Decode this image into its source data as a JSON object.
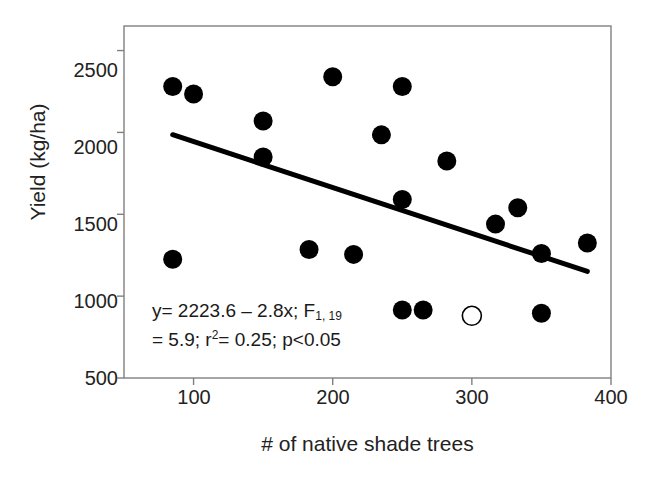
{
  "chart_data": {
    "type": "scatter",
    "title": "",
    "xlabel": "# of native shade trees",
    "ylabel": "Yield (kg/ha)",
    "xlim": [
      50,
      400
    ],
    "ylim": [
      500,
      2650
    ],
    "xticks": [
      100,
      200,
      300,
      400
    ],
    "yticks": [
      500,
      1000,
      1500,
      2000,
      2500
    ],
    "grid": false,
    "legend": "none",
    "series": [
      {
        "name": "observations",
        "marker": "filled-circle",
        "color": "#000000",
        "points": [
          {
            "x": 85,
            "y": 2280
          },
          {
            "x": 100,
            "y": 2235
          },
          {
            "x": 150,
            "y": 2070
          },
          {
            "x": 150,
            "y": 1850
          },
          {
            "x": 200,
            "y": 2340
          },
          {
            "x": 235,
            "y": 1985
          },
          {
            "x": 250,
            "y": 2280
          },
          {
            "x": 250,
            "y": 1590
          },
          {
            "x": 282,
            "y": 1825
          },
          {
            "x": 317,
            "y": 1440
          },
          {
            "x": 333,
            "y": 1540
          },
          {
            "x": 350,
            "y": 1260
          },
          {
            "x": 383,
            "y": 1325
          },
          {
            "x": 183,
            "y": 1285
          },
          {
            "x": 215,
            "y": 1255
          },
          {
            "x": 85,
            "y": 1225
          },
          {
            "x": 250,
            "y": 915
          },
          {
            "x": 265,
            "y": 915
          },
          {
            "x": 350,
            "y": 895
          }
        ]
      },
      {
        "name": "outlier",
        "marker": "open-circle",
        "color": "#000000",
        "points": [
          {
            "x": 300,
            "y": 880
          }
        ]
      }
    ],
    "fit_line": {
      "equation": "y = 2223.6 - 2.8x",
      "intercept": 2223.6,
      "slope": -2.8,
      "x_start": 85,
      "y_start": 1986,
      "x_end": 383,
      "y_end": 1151,
      "color": "#000000",
      "width_px": 5
    },
    "annotation_lines": [
      {
        "parts": [
          {
            "text": "y= 2223.6 – 2.8x; F",
            "style": "normal"
          },
          {
            "text": "1, 19",
            "style": "sub"
          }
        ]
      },
      {
        "parts": [
          {
            "text": "= 5.9; r",
            "style": "normal"
          },
          {
            "text": "2",
            "style": "sup"
          },
          {
            "text": "= 0.25; p<0.05",
            "style": "normal"
          }
        ]
      }
    ],
    "annotation_text": "y= 2223.6 - 2.8x; F1, 19 = 5.9; r2= 0.25; p<0.05"
  },
  "axis": {
    "ytick_labels": [
      "2500",
      "2000",
      "1500",
      "1000",
      "500"
    ],
    "xtick_labels": [
      "100",
      "200",
      "300",
      "400"
    ],
    "y_title": "Yield (kg/ha)",
    "x_title": "# of native shade trees"
  },
  "style": {
    "frame_color": "#808080",
    "marker_color": "#000000",
    "background": "#ffffff"
  }
}
